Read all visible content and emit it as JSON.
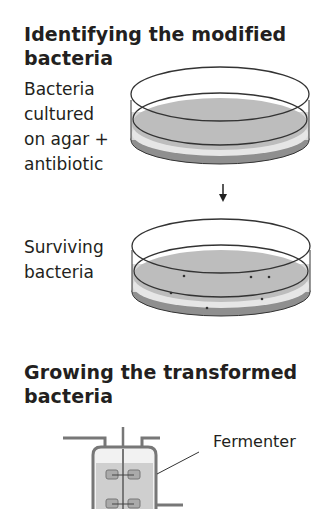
{
  "sections": [
    {
      "title_line1": "Identifying the modified",
      "title_line2": "bacteria",
      "steps": [
        {
          "label_lines": [
            "Bacteria",
            "cultured",
            "on agar +",
            "antibiotic"
          ],
          "figure": "petri-dish-agar"
        },
        {
          "label_lines": [
            "Surviving",
            "bacteria"
          ],
          "figure": "petri-dish-with-colonies"
        }
      ],
      "arrow": "down-arrow"
    },
    {
      "title_line1": "Growing the transformed",
      "title_line2": "bacteria",
      "figure": "fermenter",
      "callout": "Fermenter"
    }
  ],
  "colors": {
    "agar": "#bdbdbd",
    "outline": "#333333",
    "rim": "#8f8f8f",
    "fermenter_fill": "#c8c8c8"
  }
}
